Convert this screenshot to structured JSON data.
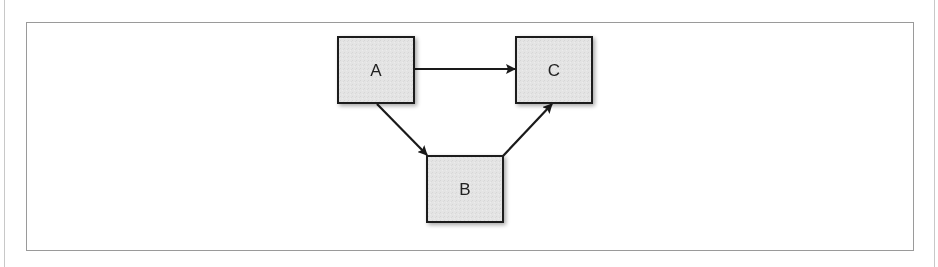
{
  "diagram": {
    "type": "directed-graph",
    "nodes": [
      {
        "id": "A",
        "label": "A",
        "x": 338,
        "y": 37,
        "w": 76,
        "h": 66
      },
      {
        "id": "B",
        "label": "B",
        "x": 427,
        "y": 156,
        "w": 76,
        "h": 66
      },
      {
        "id": "C",
        "label": "C",
        "x": 516,
        "y": 37,
        "w": 76,
        "h": 66
      }
    ],
    "edges": [
      {
        "from": "A",
        "to": "C"
      },
      {
        "from": "A",
        "to": "B"
      },
      {
        "from": "B",
        "to": "C"
      }
    ],
    "colors": {
      "node_fill": "#e3e3e3",
      "node_border": "#1e1e1e",
      "edge": "#1a1a1a",
      "frame_border": "#9a9a9a"
    }
  }
}
